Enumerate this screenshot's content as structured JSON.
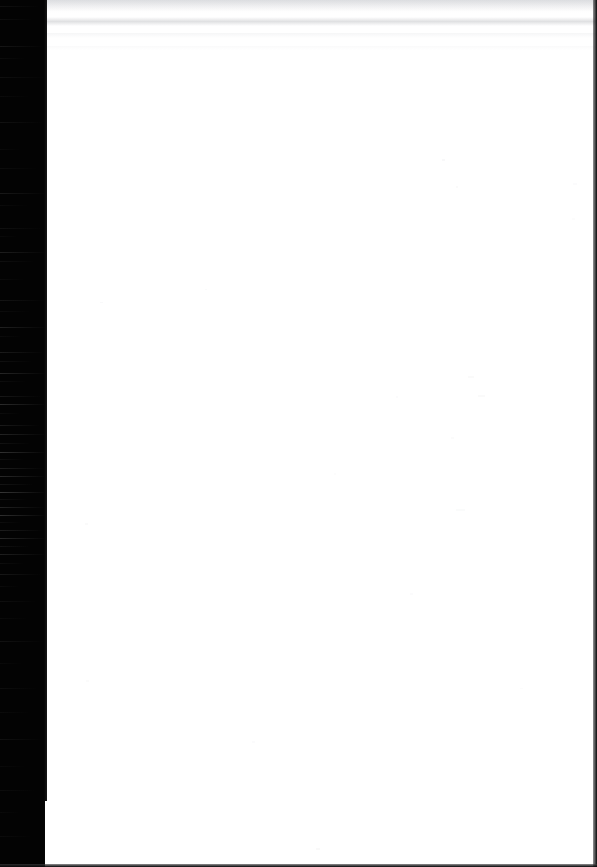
{
  "document": {
    "kind": "scanned-page",
    "title": "Scanned Blank Page",
    "page_content_text": "",
    "body_text": "",
    "notes": ""
  },
  "canvas": {
    "width": 597,
    "height": 867,
    "paper_color": "#ffffff",
    "background_color": "#000000"
  },
  "artifacts": {
    "left_band": {
      "name": "scanner-black-band",
      "color": "#030303",
      "x": 0,
      "width": 47,
      "streak_color": "#8a8a8a"
    },
    "right_edge": {
      "name": "page-right-dark-edge",
      "color": "#0a0a0b",
      "width": 4
    },
    "bottom_edge": {
      "name": "page-bottom-dark-edge",
      "color": "#070708",
      "height": 3
    },
    "top_banding": {
      "name": "scanner-top-banding",
      "color": "#989aa0"
    }
  },
  "streaks": [
    {
      "top": 6,
      "width": 40,
      "opacity": 0.1
    },
    {
      "top": 19,
      "width": 33,
      "opacity": 0.08
    },
    {
      "top": 46,
      "width": 44,
      "opacity": 0.14
    },
    {
      "top": 58,
      "width": 25,
      "opacity": 0.07
    },
    {
      "top": 77,
      "width": 46,
      "opacity": 0.09
    },
    {
      "top": 96,
      "width": 30,
      "opacity": 0.06
    },
    {
      "top": 122,
      "width": 44,
      "opacity": 0.11
    },
    {
      "top": 149,
      "width": 20,
      "opacity": 0.05
    },
    {
      "top": 168,
      "width": 38,
      "opacity": 0.07
    },
    {
      "top": 193,
      "width": 47,
      "opacity": 0.16
    },
    {
      "top": 205,
      "width": 28,
      "opacity": 0.06
    },
    {
      "top": 228,
      "width": 43,
      "opacity": 0.1
    },
    {
      "top": 236,
      "width": 18,
      "opacity": 0.05
    },
    {
      "top": 252,
      "width": 47,
      "opacity": 0.2
    },
    {
      "top": 261,
      "width": 35,
      "opacity": 0.09
    },
    {
      "top": 279,
      "width": 24,
      "opacity": 0.06
    },
    {
      "top": 300,
      "width": 45,
      "opacity": 0.13
    },
    {
      "top": 311,
      "width": 30,
      "opacity": 0.07
    },
    {
      "top": 327,
      "width": 47,
      "opacity": 0.22
    },
    {
      "top": 336,
      "width": 22,
      "opacity": 0.06
    },
    {
      "top": 352,
      "width": 44,
      "opacity": 0.18
    },
    {
      "top": 361,
      "width": 33,
      "opacity": 0.1
    },
    {
      "top": 373,
      "width": 47,
      "opacity": 0.26
    },
    {
      "top": 381,
      "width": 26,
      "opacity": 0.08
    },
    {
      "top": 396,
      "width": 42,
      "opacity": 0.15
    },
    {
      "top": 404,
      "width": 47,
      "opacity": 0.3
    },
    {
      "top": 413,
      "width": 20,
      "opacity": 0.07
    },
    {
      "top": 425,
      "width": 40,
      "opacity": 0.17
    },
    {
      "top": 434,
      "width": 47,
      "opacity": 0.24
    },
    {
      "top": 443,
      "width": 31,
      "opacity": 0.11
    },
    {
      "top": 452,
      "width": 47,
      "opacity": 0.34
    },
    {
      "top": 459,
      "width": 24,
      "opacity": 0.09
    },
    {
      "top": 468,
      "width": 44,
      "opacity": 0.2
    },
    {
      "top": 476,
      "width": 47,
      "opacity": 0.28
    },
    {
      "top": 484,
      "width": 34,
      "opacity": 0.13
    },
    {
      "top": 492,
      "width": 47,
      "opacity": 0.38
    },
    {
      "top": 499,
      "width": 27,
      "opacity": 0.1
    },
    {
      "top": 507,
      "width": 45,
      "opacity": 0.23
    },
    {
      "top": 515,
      "width": 47,
      "opacity": 0.32
    },
    {
      "top": 522,
      "width": 21,
      "opacity": 0.08
    },
    {
      "top": 530,
      "width": 43,
      "opacity": 0.19
    },
    {
      "top": 538,
      "width": 47,
      "opacity": 0.27
    },
    {
      "top": 546,
      "width": 30,
      "opacity": 0.11
    },
    {
      "top": 554,
      "width": 47,
      "opacity": 0.21
    },
    {
      "top": 563,
      "width": 25,
      "opacity": 0.08
    },
    {
      "top": 574,
      "width": 42,
      "opacity": 0.15
    },
    {
      "top": 586,
      "width": 19,
      "opacity": 0.06
    },
    {
      "top": 601,
      "width": 36,
      "opacity": 0.09
    },
    {
      "top": 618,
      "width": 28,
      "opacity": 0.06
    },
    {
      "top": 641,
      "width": 44,
      "opacity": 0.11
    },
    {
      "top": 663,
      "width": 22,
      "opacity": 0.05
    },
    {
      "top": 688,
      "width": 38,
      "opacity": 0.08
    },
    {
      "top": 712,
      "width": 30,
      "opacity": 0.06
    },
    {
      "top": 739,
      "width": 43,
      "opacity": 0.1
    },
    {
      "top": 766,
      "width": 26,
      "opacity": 0.05
    },
    {
      "top": 790,
      "width": 35,
      "opacity": 0.07
    },
    {
      "top": 812,
      "width": 20,
      "opacity": 0.05
    },
    {
      "top": 836,
      "width": 32,
      "opacity": 0.06
    }
  ],
  "specks": [
    {
      "left": 442,
      "top": 159,
      "w": 3,
      "h": 2,
      "opacity": 0.22
    },
    {
      "left": 456,
      "top": 186,
      "w": 2,
      "h": 2,
      "opacity": 0.16
    },
    {
      "left": 205,
      "top": 289,
      "w": 2,
      "h": 1,
      "opacity": 0.14
    },
    {
      "left": 100,
      "top": 302,
      "w": 3,
      "h": 1,
      "opacity": 0.18
    },
    {
      "left": 468,
      "top": 376,
      "w": 6,
      "h": 2,
      "opacity": 0.15
    },
    {
      "left": 478,
      "top": 395,
      "w": 7,
      "h": 2,
      "opacity": 0.17
    },
    {
      "left": 396,
      "top": 396,
      "w": 2,
      "h": 2,
      "opacity": 0.12
    },
    {
      "left": 451,
      "top": 437,
      "w": 3,
      "h": 2,
      "opacity": 0.13
    },
    {
      "left": 334,
      "top": 473,
      "w": 2,
      "h": 2,
      "opacity": 0.11
    },
    {
      "left": 85,
      "top": 523,
      "w": 3,
      "h": 2,
      "opacity": 0.15
    },
    {
      "left": 456,
      "top": 509,
      "w": 9,
      "h": 2,
      "opacity": 0.14
    },
    {
      "left": 410,
      "top": 593,
      "w": 3,
      "h": 2,
      "opacity": 0.12
    },
    {
      "left": 86,
      "top": 680,
      "w": 3,
      "h": 2,
      "opacity": 0.13
    },
    {
      "left": 252,
      "top": 741,
      "w": 3,
      "h": 2,
      "opacity": 0.12
    },
    {
      "left": 316,
      "top": 848,
      "w": 4,
      "h": 2,
      "opacity": 0.2
    },
    {
      "left": 520,
      "top": 688,
      "w": 3,
      "h": 1,
      "opacity": 0.1
    },
    {
      "left": 573,
      "top": 183,
      "w": 4,
      "h": 2,
      "opacity": 0.12
    },
    {
      "left": 572,
      "top": 218,
      "w": 3,
      "h": 2,
      "opacity": 0.1
    }
  ]
}
